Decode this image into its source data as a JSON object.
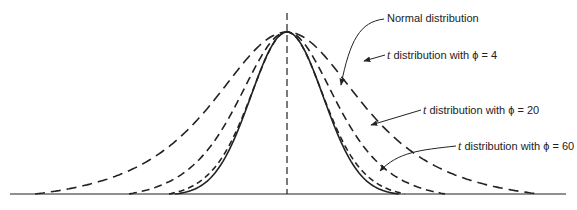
{
  "chart_data": {
    "type": "line",
    "title": "",
    "xlabel": "",
    "ylabel": "",
    "grid": false,
    "legend": "annotations with leader arrows on right side",
    "center_line": "vertical dashed line at the mean (x = 0)",
    "series": [
      {
        "name": "Normal distribution",
        "style": "solid",
        "df": null
      },
      {
        "name": "t distribution with φ = 4",
        "style": "long-dash",
        "df": 4
      },
      {
        "name": "t distribution with φ = 20",
        "style": "dash",
        "df": 20
      },
      {
        "name": "t distribution with φ = 60",
        "style": "short-dash",
        "df": 60
      }
    ]
  },
  "labels": {
    "normal": "Normal distribution",
    "t4_prefix": "t",
    "t4_text": " distribution with ϕ = 4",
    "t20_prefix": "t",
    "t20_text": " distribution with ϕ = 20",
    "t60_prefix": "t",
    "t60_text": " distribution with ϕ = 60"
  },
  "colors": {
    "ink": "#222222",
    "background": "#ffffff"
  }
}
